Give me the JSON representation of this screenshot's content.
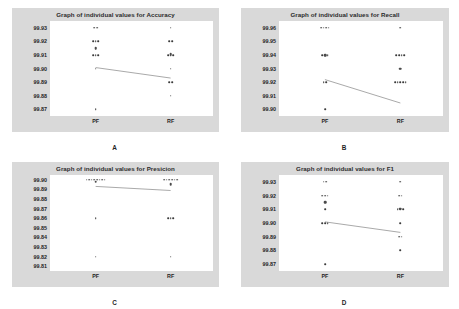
{
  "figure": {
    "background": "#ffffff",
    "panel_background": "#d9d9d9",
    "plot_background": "#ffffff",
    "point_color": "#3a3a3a",
    "line_color": "#6e6e6e"
  },
  "panels": [
    {
      "letter": "A",
      "title": "Graph of individual values for Accuracy",
      "chart_data": {
        "type": "scatter",
        "title": "Graph of individual values for Accuracy",
        "xlabel": "",
        "ylabel": "",
        "categories": [
          "PF",
          "RF"
        ],
        "ylim": [
          99.865,
          99.935
        ],
        "yticks": [
          "99.93",
          "99.92",
          "99.91",
          "99.90",
          "99.89",
          "99.88",
          "99.87"
        ],
        "ytick_values": [
          99.93,
          99.92,
          99.91,
          99.9,
          99.89,
          99.88,
          99.87
        ],
        "grid": false,
        "legend": "none",
        "series": [
          {
            "name": "PF",
            "x": "PF",
            "values": [
              99.93,
              99.93,
              99.92,
              99.92,
              99.92,
              99.915,
              99.91,
              99.91,
              99.91,
              99.9,
              99.87
            ],
            "mean": 99.915
          },
          {
            "name": "RF",
            "x": "RF",
            "values": [
              99.93,
              99.92,
              99.92,
              99.91,
              99.91,
              99.91,
              99.9,
              99.89,
              99.89,
              99.88
            ],
            "mean": 99.9105
          }
        ]
      }
    },
    {
      "letter": "B",
      "title": "Graph of individual values for Recall",
      "chart_data": {
        "type": "scatter",
        "title": "Graph of individual values for Recall",
        "xlabel": "",
        "ylabel": "",
        "categories": [
          "PF",
          "RF"
        ],
        "ylim": [
          99.895,
          99.965
        ],
        "yticks": [
          "99.96",
          "99.95",
          "99.94",
          "99.93",
          "99.92",
          "99.91",
          "99.90"
        ],
        "ytick_values": [
          99.96,
          99.95,
          99.94,
          99.93,
          99.92,
          99.91,
          99.9
        ],
        "grid": false,
        "legend": "none",
        "series": [
          {
            "name": "PF",
            "x": "PF",
            "values": [
              99.96,
              99.96,
              99.96,
              99.96,
              99.94,
              99.94,
              99.94,
              99.92,
              99.92,
              99.9
            ],
            "mean": 99.94
          },
          {
            "name": "RF",
            "x": "RF",
            "values": [
              99.96,
              99.94,
              99.94,
              99.94,
              99.94,
              99.93,
              99.92,
              99.92,
              99.92,
              99.92,
              99.92
            ],
            "mean": 99.93
          }
        ]
      }
    },
    {
      "letter": "C",
      "title": "Graph of individual values for Presicion",
      "chart_data": {
        "type": "scatter",
        "title": "Graph of individual values for Presicion",
        "xlabel": "",
        "ylabel": "",
        "categories": [
          "PF",
          "RF"
        ],
        "ylim": [
          99.805,
          99.905
        ],
        "yticks": [
          "99.90",
          "99.89",
          "99.88",
          "99.87",
          "99.86",
          "99.85",
          "99.84",
          "99.83",
          "99.82",
          "99.81"
        ],
        "ytick_values": [
          99.9,
          99.89,
          99.88,
          99.87,
          99.86,
          99.85,
          99.84,
          99.83,
          99.82,
          99.81
        ],
        "grid": false,
        "legend": "none",
        "series": [
          {
            "name": "PF",
            "x": "PF",
            "values": [
              99.9,
              99.9,
              99.9,
              99.9,
              99.9,
              99.9,
              99.9,
              99.9,
              99.86,
              99.82
            ],
            "mean": 99.898
          },
          {
            "name": "RF",
            "x": "RF",
            "values": [
              99.9,
              99.9,
              99.9,
              99.9,
              99.9,
              99.9,
              99.86,
              99.86,
              99.86,
              99.82
            ],
            "mean": 99.8955
          }
        ]
      }
    },
    {
      "letter": "D",
      "title": "Graph of individual values for F1",
      "chart_data": {
        "type": "scatter",
        "title": "Graph of individual values for F1",
        "xlabel": "",
        "ylabel": "",
        "categories": [
          "PF",
          "RF"
        ],
        "ylim": [
          99.865,
          99.935
        ],
        "yticks": [
          "99.93",
          "99.92",
          "99.91",
          "99.90",
          "99.89",
          "99.88",
          "99.87"
        ],
        "ytick_values": [
          99.93,
          99.92,
          99.91,
          99.9,
          99.89,
          99.88,
          99.87
        ],
        "grid": false,
        "legend": "none",
        "series": [
          {
            "name": "PF",
            "x": "PF",
            "values": [
              99.93,
              99.93,
              99.92,
              99.92,
              99.92,
              99.915,
              99.91,
              99.9,
              99.9,
              99.9,
              99.87
            ],
            "mean": 99.915
          },
          {
            "name": "RF",
            "x": "RF",
            "values": [
              99.93,
              99.92,
              99.92,
              99.91,
              99.91,
              99.91,
              99.9,
              99.89,
              99.89,
              99.88
            ],
            "mean": 99.9105
          }
        ]
      }
    }
  ]
}
